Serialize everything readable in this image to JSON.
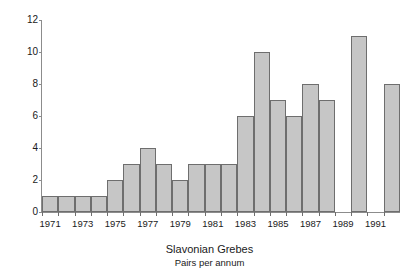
{
  "chart_data": {
    "type": "bar",
    "title": "Slavonian Grebes",
    "subtitle": "Pairs per annum",
    "xlabel": "",
    "ylabel": "",
    "ylim": [
      0,
      12
    ],
    "ytick_step": 2,
    "yticks": [
      0,
      2,
      4,
      6,
      8,
      10,
      12
    ],
    "grid": false,
    "legend": false,
    "categories": [
      "1971",
      "1972",
      "1973",
      "1974",
      "1975",
      "1976",
      "1977",
      "1978",
      "1979",
      "1980",
      "1981",
      "1982",
      "1983",
      "1984",
      "1985",
      "1986",
      "1987",
      "1988",
      "1989",
      "1990",
      "1991",
      "1992"
    ],
    "values": [
      1,
      1,
      1,
      1,
      2,
      3,
      4,
      3,
      2,
      3,
      3,
      3,
      6,
      10,
      7,
      6,
      8,
      7,
      0,
      11,
      0,
      8
    ],
    "xtick_labels": [
      "1971",
      "1973",
      "1975",
      "1977",
      "1979",
      "1981",
      "1983",
      "1985",
      "1987",
      "1989",
      "1991"
    ],
    "bar_fill_color": "#c6c6c6",
    "bar_edge_color": "#6e6e6e",
    "axis_color": "#8c8c8c",
    "text_color": "#1a1a1a",
    "background_color": "#ffffff"
  }
}
